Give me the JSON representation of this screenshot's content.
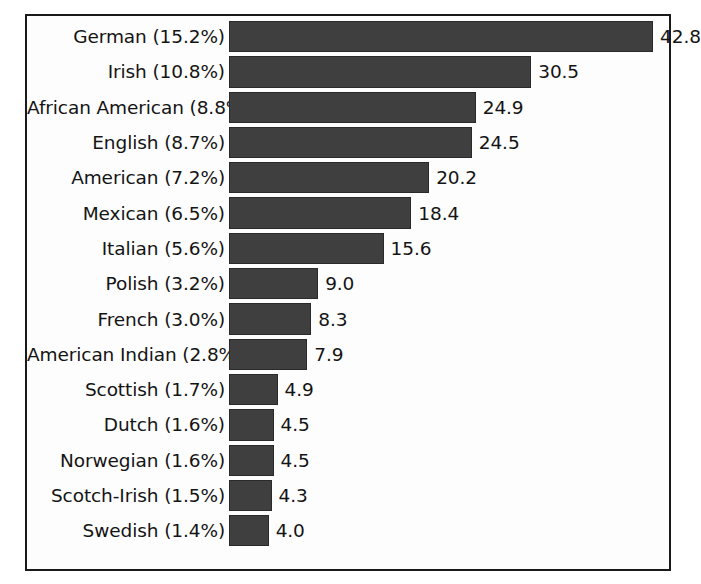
{
  "chart_data": {
    "type": "bar",
    "orientation": "horizontal",
    "title": "",
    "subtitle": "",
    "xlabel": "",
    "ylabel": "",
    "grid": false,
    "legend": "none",
    "xlim": [
      0,
      44
    ],
    "value_unit": "millions",
    "bar_color": "#3f3f3f",
    "categories": [
      "German (15.2%)",
      "Irish (10.8%)",
      "African American (8.8%)",
      "English (8.7%)",
      "American (7.2%)",
      "Mexican (6.5%)",
      "Italian (5.6%)",
      "Polish (3.2%)",
      "French (3.0%)",
      "American Indian (2.8%)",
      "Scottish (1.7%)",
      "Dutch (1.6%)",
      "Norwegian (1.6%)",
      "Scotch-Irish (1.5%)",
      "Swedish  (1.4%)"
    ],
    "group_names": [
      "German",
      "Irish",
      "African American",
      "English",
      "American",
      "Mexican",
      "Italian",
      "Polish",
      "French",
      "American Indian",
      "Scottish",
      "Dutch",
      "Norwegian",
      "Scotch-Irish",
      "Swedish"
    ],
    "percentages": [
      15.2,
      10.8,
      8.8,
      8.7,
      7.2,
      6.5,
      5.6,
      3.2,
      3.0,
      2.8,
      1.7,
      1.6,
      1.6,
      1.5,
      1.4
    ],
    "values": [
      42.8,
      30.5,
      24.9,
      24.5,
      20.2,
      18.4,
      15.6,
      9.0,
      8.3,
      7.9,
      4.9,
      4.5,
      4.5,
      4.3,
      4.0
    ],
    "value_labels": [
      "42.8",
      "30.5",
      "24.9",
      "24.5",
      "20.2",
      "18.4",
      "15.6",
      "9.0",
      "8.3",
      "7.9",
      "4.9",
      "4.5",
      "4.5",
      "4.3",
      "4.0"
    ]
  }
}
